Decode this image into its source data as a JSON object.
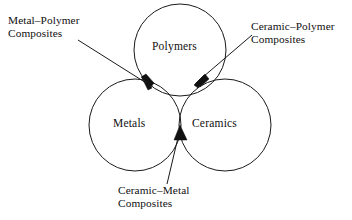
{
  "figure": {
    "type": "venn-diagram",
    "background_color": "#ffffff",
    "stroke_color": "#1a1a1a"
  },
  "circles": [
    {
      "id": "polymers",
      "label": "Polymers",
      "cx": 180,
      "cy": 50,
      "r": 46
    },
    {
      "id": "metals",
      "label": "Metals",
      "cx": 135,
      "cy": 125,
      "r": 46
    },
    {
      "id": "ceramics",
      "label": "Ceramics",
      "cx": 225,
      "cy": 125,
      "r": 46
    }
  ],
  "callouts": [
    {
      "id": "metal-polymer",
      "line1": "Metal–Polymer",
      "line2": "Composites",
      "points_to": "metals-polymers-intersection",
      "arrow_x": 150,
      "arrow_y": 85
    },
    {
      "id": "ceramic-polymer",
      "line1": "Ceramic–Polymer",
      "line2": "Composites",
      "points_to": "ceramics-polymers-intersection",
      "arrow_x": 197,
      "arrow_y": 82
    },
    {
      "id": "ceramic-metal",
      "line1": "Ceramic–Metal",
      "line2": "Composites",
      "points_to": "ceramics-metals-intersection",
      "arrow_x": 180,
      "arrow_y": 127
    }
  ]
}
